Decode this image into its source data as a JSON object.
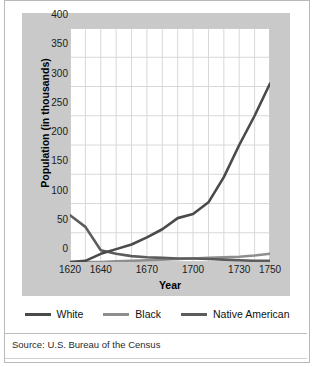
{
  "chart_data": {
    "type": "line",
    "title": "",
    "xlabel": "Year",
    "ylabel": "Population (in thousands)",
    "xlim": [
      1620,
      1750
    ],
    "ylim": [
      0,
      400
    ],
    "yticks": [
      0,
      50,
      100,
      150,
      200,
      250,
      300,
      350,
      400
    ],
    "xticks": [
      1620,
      1640,
      1670,
      1700,
      1730,
      1750
    ],
    "grid": true,
    "legend_position": "bottom",
    "source": "Source: U.S. Bureau of the Census",
    "series": [
      {
        "name": "White",
        "color": "#4a4a4a",
        "x": [
          1620,
          1630,
          1640,
          1650,
          1660,
          1670,
          1680,
          1690,
          1700,
          1710,
          1720,
          1730,
          1740,
          1750
        ],
        "values": [
          0,
          2,
          14,
          22,
          30,
          42,
          56,
          75,
          82,
          102,
          145,
          200,
          250,
          305
        ]
      },
      {
        "name": "Black",
        "color": "#8e8e8e",
        "x": [
          1620,
          1630,
          1640,
          1650,
          1660,
          1670,
          1680,
          1690,
          1700,
          1710,
          1720,
          1730,
          1740,
          1750
        ],
        "values": [
          0,
          0,
          0,
          1,
          2,
          3,
          4,
          5,
          6,
          7,
          8,
          9,
          11,
          14
        ]
      },
      {
        "name": "Native American",
        "color": "#5c5c5c",
        "x": [
          1620,
          1630,
          1640,
          1650,
          1660,
          1670,
          1680,
          1690,
          1700,
          1710,
          1720,
          1730,
          1740,
          1750
        ],
        "values": [
          80,
          60,
          20,
          14,
          10,
          8,
          7,
          6,
          6,
          5,
          4,
          3,
          2,
          2
        ]
      }
    ]
  },
  "axes": {
    "ylabel": "Population (in thousands)",
    "xlabel": "Year",
    "yticks": [
      "400",
      "350",
      "300",
      "250",
      "200",
      "150",
      "100",
      "50",
      "0"
    ],
    "xticks": [
      "1620",
      "1640",
      "1670",
      "1700",
      "1730",
      "1750"
    ]
  },
  "legend": {
    "items": [
      {
        "label": "White",
        "color": "#4a4a4a"
      },
      {
        "label": "Black",
        "color": "#8e8e8e"
      },
      {
        "label": "Native American",
        "color": "#5c5c5c"
      }
    ]
  },
  "footer": {
    "source": "Source: U.S. Bureau of the Census"
  },
  "colors": {
    "panel_bg": "#c9c9c9",
    "plot_bg": "#ffffff",
    "grid": "#d8d8d8",
    "frame": "#b9b9b9",
    "text": "#1a1a1a"
  }
}
